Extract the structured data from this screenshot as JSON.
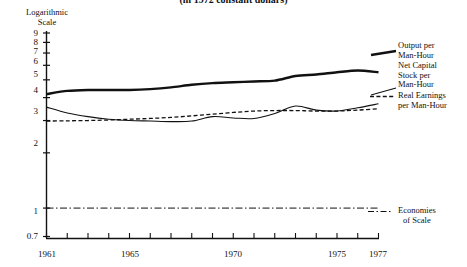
{
  "title": "(in 1972 constant dollars)",
  "axis_caption_line1": "Logarithmic",
  "axis_caption_line2": "Scale",
  "legend": {
    "output_line1": "Output per",
    "output_line2": "Man-Hour",
    "capital_line1": "Net Capital",
    "capital_line2": "Stock per",
    "capital_line3": "Man-Hour",
    "earnings_line1": "Real Earnings",
    "earnings_line2": "per Man-Hour",
    "scale_line1": "Economies",
    "scale_line2": "of Scale"
  },
  "chart_data": {
    "type": "line",
    "title": "(in 1972 constant dollars)",
    "xlabel": "",
    "ylabel": "Logarithmic Scale",
    "yscale": "log",
    "ylim": [
      0.7,
      9
    ],
    "xlim": [
      1961,
      1977
    ],
    "grid": false,
    "legend_position": "right",
    "ytick_labels": [
      "9",
      "8",
      "7",
      "6",
      "5",
      "4",
      "3",
      "2",
      "1",
      "0.7"
    ],
    "ytick_values": [
      9,
      8,
      7,
      6,
      5,
      4,
      3,
      2,
      1,
      0.7
    ],
    "xtick_labels": [
      "1961",
      "1965",
      "1970",
      "1975",
      "1977"
    ],
    "xtick_values": [
      1961,
      1965,
      1970,
      1975,
      1977
    ],
    "x": [
      1961,
      1962,
      1963,
      1964,
      1965,
      1966,
      1967,
      1968,
      1969,
      1970,
      1971,
      1972,
      1973,
      1974,
      1975,
      1976,
      1977
    ],
    "series": [
      {
        "name": "Output per Man-Hour",
        "style": "solid-thick",
        "values": [
          4.18,
          4.35,
          4.4,
          4.4,
          4.4,
          4.45,
          4.55,
          4.7,
          4.8,
          4.85,
          4.9,
          4.95,
          5.25,
          5.35,
          5.5,
          5.62,
          5.5
        ]
      },
      {
        "name": "Net Capital Stock per Man-Hour",
        "style": "solid-thin",
        "values": [
          3.55,
          3.3,
          3.15,
          3.05,
          3.0,
          2.98,
          2.96,
          2.98,
          3.15,
          3.1,
          3.08,
          3.28,
          3.6,
          3.42,
          3.38,
          3.52,
          3.7
        ]
      },
      {
        "name": "Real Earnings per Man-Hour",
        "style": "dashed",
        "values": [
          2.98,
          2.99,
          3.0,
          3.02,
          3.05,
          3.08,
          3.12,
          3.18,
          3.25,
          3.32,
          3.38,
          3.4,
          3.4,
          3.38,
          3.38,
          3.42,
          3.48
        ]
      },
      {
        "name": "Economies of Scale",
        "style": "dash-dot",
        "values": [
          1.0,
          1.0,
          1.0,
          1.0,
          1.0,
          1.0,
          1.0,
          1.0,
          1.0,
          1.0,
          1.0,
          1.0,
          1.0,
          1.0,
          1.0,
          1.0,
          1.0
        ]
      }
    ]
  }
}
